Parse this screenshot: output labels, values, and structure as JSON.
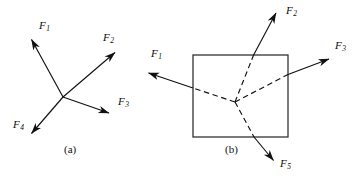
{
  "figure": {
    "kind": "free-body-force-diagram",
    "width": 363,
    "height": 181,
    "background_color": "#ffffff",
    "ink_color": "#111111",
    "panels": [
      {
        "id": "panel-a",
        "caption": "(a)",
        "caption_x": 64,
        "caption_y": 150,
        "description": "Four concurrent force vectors radiating from a single point",
        "origin": {
          "x": 63,
          "y": 97
        },
        "shape": "none",
        "vectors": [
          {
            "name": "F1",
            "label_text": "F",
            "label_sub": "1",
            "label_x": 39,
            "label_y": 26,
            "tip": {
              "x": 30,
              "y": 38
            },
            "tail": {
              "x": 63,
              "y": 97
            },
            "style": "solid"
          },
          {
            "name": "F2",
            "label_text": "F",
            "label_sub": "2",
            "label_x": 103,
            "label_y": 38,
            "tip": {
              "x": 117,
              "y": 51
            },
            "tail": {
              "x": 63,
              "y": 97
            },
            "style": "solid"
          },
          {
            "name": "F3",
            "label_text": "F",
            "label_sub": "3",
            "label_x": 118,
            "label_y": 101,
            "tip": {
              "x": 111,
              "y": 114
            },
            "tail": {
              "x": 63,
              "y": 97
            },
            "style": "solid"
          },
          {
            "name": "F4",
            "label_text": "F",
            "label_sub": "4",
            "label_x": 14,
            "label_y": 124,
            "tip": {
              "x": 30,
              "y": 135
            },
            "tail": {
              "x": 63,
              "y": 97
            },
            "style": "solid"
          }
        ]
      },
      {
        "id": "panel-b",
        "caption": "(b)",
        "caption_x": 225,
        "caption_y": 150,
        "description": "Rigid body (rectangle) with four forces applied along lines of action through an interior point; lines of action drawn dashed inside the body",
        "origin": {
          "x": 235,
          "y": 102
        },
        "shape": "rectangle",
        "rect": {
          "x": 193,
          "y": 55,
          "width": 95,
          "height": 82
        },
        "vectors": [
          {
            "name": "F1",
            "label_text": "F",
            "label_sub": "1",
            "label_x": 152,
            "label_y": 54,
            "tip": {
              "x": 146,
              "y": 72
            },
            "tail": {
              "x": 235,
              "y": 102
            },
            "style": "solid-outside-dashed-inside"
          },
          {
            "name": "F2",
            "label_text": "F",
            "label_sub": "2",
            "label_x": 288,
            "label_y": 10,
            "tip": {
              "x": 277,
              "y": 11
            },
            "tail": {
              "x": 235,
              "y": 102
            },
            "style": "solid-outside-dashed-inside"
          },
          {
            "name": "F3",
            "label_text": "F",
            "label_sub": "3",
            "label_x": 336,
            "label_y": 46,
            "tip": {
              "x": 331,
              "y": 58
            },
            "tail": {
              "x": 235,
              "y": 102
            },
            "style": "solid-outside-dashed-inside"
          },
          {
            "name": "F5",
            "label_text": "F",
            "label_sub": "5",
            "label_x": 281,
            "label_y": 163,
            "tip": {
              "x": 275,
              "y": 162
            },
            "tail": {
              "x": 235,
              "y": 102
            },
            "style": "solid-outside-dashed-inside"
          }
        ]
      }
    ]
  }
}
